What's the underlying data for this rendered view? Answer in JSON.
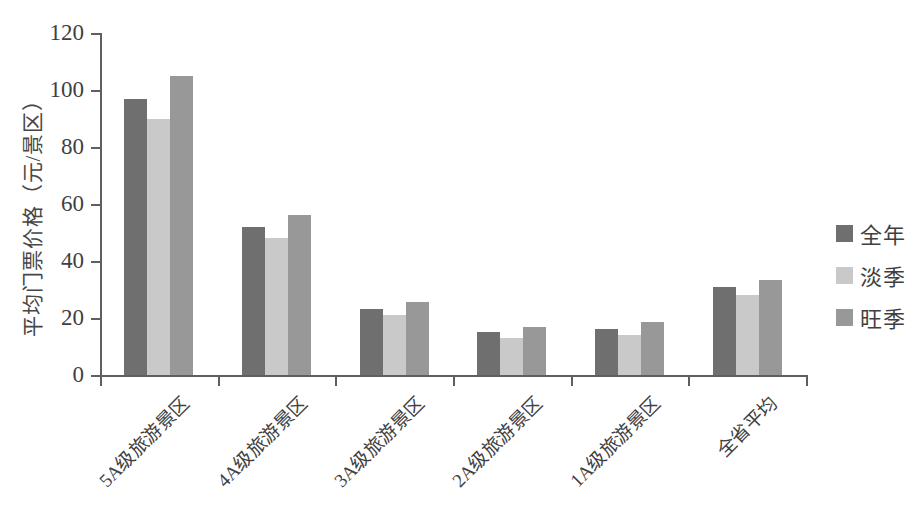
{
  "chart_data": {
    "type": "bar",
    "title": "",
    "subtitle": "",
    "xlabel": "",
    "ylabel": "平均门票价格（元/景区）",
    "ylim": [
      0,
      120
    ],
    "ytick_labels": [
      "120",
      "100",
      "80",
      "60",
      "40",
      "20",
      "0"
    ],
    "ytick_values": [
      120,
      100,
      80,
      60,
      40,
      20,
      0
    ],
    "grid": false,
    "legend_position": "right",
    "categories": [
      "5A级旅游景区",
      "4A级旅游景区",
      "3A级旅游景区",
      "2A级旅游景区",
      "1A级旅游景区",
      "全省平均"
    ],
    "series": [
      {
        "name": "全年",
        "color": "#6f6f6f",
        "values": [
          97,
          52,
          23,
          15,
          16,
          31
        ]
      },
      {
        "name": "淡季",
        "color": "#c9c9c9",
        "values": [
          90,
          48,
          21,
          13,
          14,
          28
        ]
      },
      {
        "name": "旺季",
        "color": "#989898",
        "values": [
          105,
          56,
          25.5,
          17,
          18.5,
          33.5
        ]
      }
    ]
  },
  "legend": {
    "items": [
      {
        "label": "全年",
        "color": "#6f6f6f"
      },
      {
        "label": "淡季",
        "color": "#c9c9c9"
      },
      {
        "label": "旺季",
        "color": "#989898"
      }
    ]
  },
  "axis": {
    "y_title": "平均门票价格（元/景区）"
  }
}
